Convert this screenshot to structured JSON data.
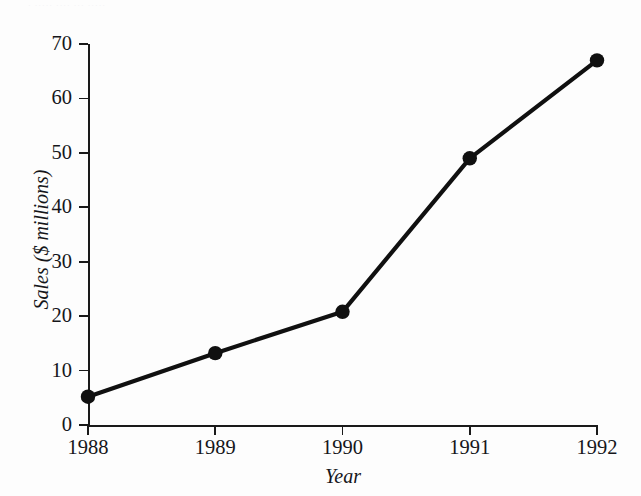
{
  "scan": {
    "bleed_text": "· ····· ···· ··· ·····"
  },
  "chart_data": {
    "type": "line",
    "title": "",
    "xlabel": "Year",
    "ylabel": "Sales ($ millions)",
    "categories": [
      "1988",
      "1989",
      "1990",
      "1991",
      "1992"
    ],
    "x": [
      1988,
      1989,
      1990,
      1991,
      1992
    ],
    "values": [
      5.2,
      13.2,
      20.8,
      49.0,
      67.0
    ],
    "series": [
      {
        "name": "Sales",
        "values": [
          5.2,
          13.2,
          20.8,
          49.0,
          67.0
        ]
      }
    ],
    "xlim": [
      1988,
      1992
    ],
    "ylim": [
      0,
      70
    ],
    "yticks": [
      0,
      10,
      20,
      30,
      40,
      50,
      60,
      70
    ],
    "ytick_labels": [
      "0",
      "10",
      "20",
      "30",
      "40",
      "50",
      "60",
      "70"
    ],
    "xticks": [
      1988,
      1989,
      1990,
      1991,
      1992
    ],
    "xtick_labels": [
      "1988",
      "1989",
      "1990",
      "1991",
      "1992"
    ],
    "grid": false,
    "legend": false,
    "legend_position": "none",
    "marker": "circle",
    "line_color": "#101010",
    "marker_color": "#101010",
    "background_color": "#fdfdfd",
    "axis_color": "#1a1a1a"
  }
}
